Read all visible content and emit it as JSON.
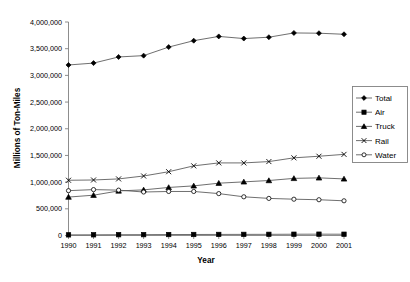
{
  "chart_data": {
    "type": "line",
    "title": "",
    "xlabel": "Year",
    "ylabel": "Millions of Ton-Miles",
    "categories": [
      "1990",
      "1991",
      "1992",
      "1993",
      "1994",
      "1995",
      "1996",
      "1997",
      "1998",
      "1999",
      "2000",
      "2001"
    ],
    "x": [
      1990,
      1991,
      1992,
      1993,
      1994,
      1995,
      1996,
      1997,
      1998,
      1999,
      2000,
      2001
    ],
    "ylim": [
      0,
      4000000
    ],
    "xlim": [
      1990,
      2001
    ],
    "ytick_labels": [
      "0",
      "500,000",
      "1,000,000",
      "1,500,000",
      "2,000,000",
      "2,500,000",
      "3,000,000",
      "3,500,000",
      "4,000,000"
    ],
    "ytick_values": [
      0,
      500000,
      1000000,
      1500000,
      2000000,
      2500000,
      3000000,
      3500000,
      4000000
    ],
    "grid": false,
    "legend_position": "right",
    "series": [
      {
        "name": "Total",
        "marker": "diamond",
        "values": [
          3195000,
          3230000,
          3345000,
          3370000,
          3530000,
          3650000,
          3730000,
          3690000,
          3715000,
          3795000,
          3790000,
          3770000
        ]
      },
      {
        "name": "Air",
        "marker": "square",
        "values": [
          12000,
          13000,
          15000,
          16000,
          18000,
          19000,
          20000,
          21000,
          22000,
          24000,
          25000,
          24000
        ]
      },
      {
        "name": "Truck",
        "marker": "triangle",
        "values": [
          720000,
          755000,
          835000,
          855000,
          900000,
          930000,
          980000,
          1005000,
          1030000,
          1070000,
          1080000,
          1060000
        ]
      },
      {
        "name": "Rail",
        "marker": "cross",
        "values": [
          1035000,
          1040000,
          1060000,
          1115000,
          1195000,
          1305000,
          1360000,
          1360000,
          1385000,
          1455000,
          1485000,
          1520000
        ]
      },
      {
        "name": "Water",
        "marker": "circle",
        "values": [
          840000,
          860000,
          850000,
          815000,
          825000,
          825000,
          785000,
          725000,
          695000,
          680000,
          670000,
          650000
        ]
      }
    ]
  },
  "legend": {
    "items": [
      {
        "label": "Total"
      },
      {
        "label": "Air"
      },
      {
        "label": "Truck"
      },
      {
        "label": "Rail"
      },
      {
        "label": "Water"
      }
    ]
  },
  "colors": {
    "line": "#555555",
    "marker": "#000000",
    "axis": "#808080",
    "background": "#ffffff"
  }
}
